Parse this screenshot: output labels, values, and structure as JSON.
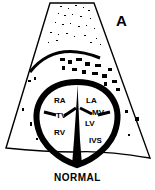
{
  "figure": {
    "panel_letter": "A",
    "caption": "NORMAL",
    "labels": {
      "ra": "RA",
      "la": "LA",
      "tv": "TV",
      "mv": "MV",
      "lv": "LV",
      "rv": "RV",
      "ivs": "IVS"
    },
    "colors": {
      "ink": "#000000",
      "background": "#ffffff"
    }
  }
}
